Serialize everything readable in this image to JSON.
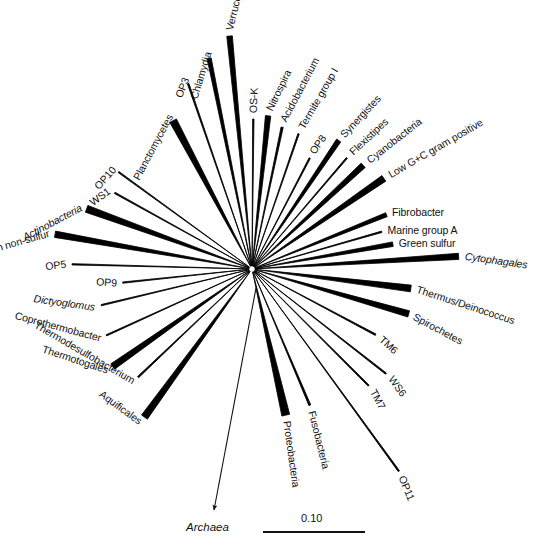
{
  "figure": {
    "type": "unrooted-phylogenetic-tree",
    "background_color": "#ffffff",
    "line_color": "#000000",
    "center": {
      "x": 252,
      "y": 269
    }
  },
  "chart_data": {
    "type": "diagram",
    "title": "",
    "subtitle": "",
    "xlabel": "",
    "ylabel": "",
    "legend": [],
    "scale_bar": {
      "label": "0.10",
      "value": 0.1,
      "length_px": 102
    },
    "outgroup": {
      "label": "Archaea",
      "italic": true
    },
    "taxa": [
      {
        "label": "Planctomycetes",
        "italic": false,
        "angle": -118.0,
        "length": 168,
        "width": 7.5,
        "label_angle": -62
      },
      {
        "label": "OP3",
        "italic": false,
        "angle": -109.0,
        "length": 196,
        "width": 1.6,
        "label_angle": -68
      },
      {
        "label": "Chlamydia",
        "italic": false,
        "angle": -101.5,
        "length": 215,
        "width": 4.2,
        "label_angle": -73
      },
      {
        "label": "Verrucomicrobia",
        "italic": false,
        "angle": -95.5,
        "length": 234,
        "width": 5.6,
        "label_angle": -76
      },
      {
        "label": "OS-K",
        "italic": false,
        "angle": -89.5,
        "length": 150,
        "width": 1.4,
        "label_angle": -88
      },
      {
        "label": "Nitrospira",
        "italic": false,
        "angle": -84.0,
        "length": 154,
        "width": 5.4,
        "label_angle": -64
      },
      {
        "label": "Acidobacterium",
        "italic": false,
        "angle": -78.0,
        "length": 145,
        "width": 2.2,
        "label_angle": -62
      },
      {
        "label": "Termite group I",
        "italic": false,
        "angle": -71.0,
        "length": 143,
        "width": 1.4,
        "label_angle": -60
      },
      {
        "label": "OP8",
        "italic": false,
        "angle": -62.5,
        "length": 125,
        "width": 1.4,
        "label_angle": -56
      },
      {
        "label": "Synergistes",
        "italic": false,
        "angle": -56.0,
        "length": 155,
        "width": 5.0,
        "label_angle": -47
      },
      {
        "label": "Flexistipes",
        "italic": false,
        "angle": -49.5,
        "length": 146,
        "width": 1.4,
        "label_angle": -43
      },
      {
        "label": "Cyanobacteria",
        "italic": false,
        "angle": -43.0,
        "length": 152,
        "width": 6.0,
        "label_angle": -38
      },
      {
        "label": "Low G+C gram positive",
        "italic": false,
        "angle": -34.5,
        "length": 160,
        "width": 6.8,
        "label_angle": -30
      },
      {
        "label": "Fibrobacter",
        "italic": false,
        "angle": -22.0,
        "length": 145,
        "width": 4.2,
        "label_angle": 0
      },
      {
        "label": "Marine group A",
        "italic": false,
        "angle": -16.0,
        "length": 135,
        "width": 1.4,
        "label_angle": 0
      },
      {
        "label": "Green sulfur",
        "italic": false,
        "angle": -10.0,
        "length": 143,
        "width": 4.6,
        "label_angle": 0
      },
      {
        "label": "Cytophagales",
        "italic": true,
        "angle": -3.5,
        "length": 207,
        "width": 6.2,
        "label_angle": 8
      },
      {
        "label": "Thermus/Deinococcus",
        "italic": false,
        "angle": 7.0,
        "length": 160,
        "width": 6.8,
        "label_angle": 18
      },
      {
        "label": "Spirochetes",
        "italic": false,
        "angle": 16.0,
        "length": 163,
        "width": 6.4,
        "label_angle": 28
      },
      {
        "label": "TM6",
        "italic": false,
        "angle": 28.0,
        "length": 140,
        "width": 1.6,
        "label_angle": 42
      },
      {
        "label": "WS6",
        "italic": false,
        "angle": 38.0,
        "length": 170,
        "width": 1.5,
        "label_angle": 54
      },
      {
        "label": "TM7",
        "italic": false,
        "angle": 45.0,
        "length": 165,
        "width": 1.5,
        "label_angle": 62
      },
      {
        "label": "OP11",
        "italic": false,
        "angle": 54.0,
        "length": 250,
        "width": 1.5,
        "label_angle": 68
      },
      {
        "label": "Fusobacteria",
        "italic": false,
        "angle": 67.0,
        "length": 148,
        "width": 2.0,
        "label_angle": 76
      },
      {
        "label": "Proteobacteria",
        "italic": false,
        "angle": 77.0,
        "length": 150,
        "width": 8.0,
        "label_angle": 82
      },
      {
        "label": "Aquificales",
        "italic": false,
        "angle": 126.0,
        "length": 183,
        "width": 7.2,
        "label_angle": 36
      },
      {
        "label": "Thermodesulfobacterium",
        "italic": false,
        "angle": 136.5,
        "length": 157,
        "width": 1.6,
        "label_angle": 30
      },
      {
        "label": "Thermotogales",
        "italic": false,
        "angle": 145.0,
        "length": 170,
        "width": 6.6,
        "label_angle": 18
      },
      {
        "label": "Coprothermobacter",
        "italic": false,
        "angle": 155.5,
        "length": 160,
        "width": 1.3,
        "label_angle": 15
      },
      {
        "label": "Dictyoglomus",
        "italic": true,
        "angle": 166.5,
        "length": 155,
        "width": 1.3,
        "label_angle": 8
      },
      {
        "label": "OP9",
        "italic": false,
        "angle": 174.0,
        "length": 130,
        "width": 1.3,
        "label_angle": 4
      },
      {
        "label": "OP5",
        "italic": false,
        "angle": 181.5,
        "length": 180,
        "width": 1.3,
        "label_angle": -6
      },
      {
        "label": "Green non-sulfur",
        "italic": false,
        "angle": 190.0,
        "length": 200,
        "width": 6.4,
        "label_angle": -16
      },
      {
        "label": "Actinobacteria",
        "italic": true,
        "angle": 200.0,
        "length": 176,
        "width": 7.2,
        "label_angle": -28
      },
      {
        "label": "WS1",
        "italic": false,
        "angle": 209.0,
        "length": 157,
        "width": 1.4,
        "label_angle": -36
      },
      {
        "label": "OP10",
        "italic": false,
        "angle": 216.0,
        "length": 165,
        "width": 1.4,
        "label_angle": -48
      }
    ]
  },
  "labels": {
    "planctomycetes": "Planctomycetes",
    "op3": "OP3",
    "chlamydia": "Chlamydia",
    "verrucomicrobia": "Verrucomicrobia",
    "os_k": "OS-K",
    "nitrospira": "Nitrospira",
    "acidobacterium": "Acidobacterium",
    "termite_group_i": "Termite group I",
    "op8": "OP8",
    "synergistes": "Synergistes",
    "flexistipes": "Flexistipes",
    "cyanobacteria": "Cyanobacteria",
    "low_gc_gram_positive": "Low G+C gram positive",
    "fibrobacter": "Fibrobacter",
    "marine_group_a": "Marine group A",
    "green_sulfur": "Green sulfur",
    "cytophagales": "Cytophagales",
    "thermus_deinococcus": "Thermus/Deinococcus",
    "spirochetes": "Spirochetes",
    "tm6": "TM6",
    "ws6": "WS6",
    "tm7": "TM7",
    "op11": "OP11",
    "fusobacteria": "Fusobacteria",
    "proteobacteria": "Proteobacteria",
    "aquificales": "Aquificales",
    "thermodesulfobacterium": "Thermodesulfobacterium",
    "thermotogales": "Thermotogales",
    "coprothermobacter": "Coprothermobacter",
    "dictyoglomus": "Dictyoglomus",
    "op9": "OP9",
    "op5": "OP5",
    "green_non_sulfur": "Green non-sulfur",
    "actinobacteria": "Actinobacteria",
    "ws1": "WS1",
    "op10": "OP10",
    "archaea": "Archaea",
    "scale": "0.10"
  }
}
